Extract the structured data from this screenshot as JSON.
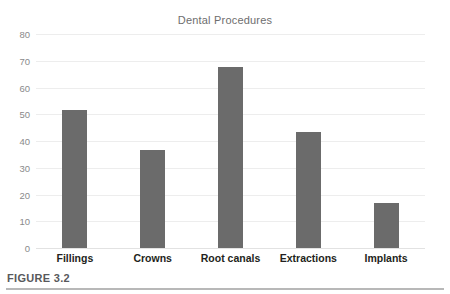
{
  "figure": {
    "caption": "FIGURE 3.2"
  },
  "chart_data": {
    "type": "bar",
    "title": "Dental Procedures",
    "xlabel": "",
    "ylabel": "",
    "categories": [
      "Fillings",
      "Crowns",
      "Root canals",
      "Extractions",
      "Implants"
    ],
    "values": [
      51.5,
      36.5,
      67.5,
      43.5,
      17
    ],
    "ylim": [
      0,
      80
    ],
    "ytick_labels": [
      "80",
      "70",
      "60",
      "50",
      "40",
      "30",
      "20",
      "10",
      "0"
    ],
    "ytick_values": [
      80,
      70,
      60,
      50,
      40,
      30,
      20,
      10,
      0
    ],
    "ytick_step": 10,
    "grid": true,
    "legend": false,
    "bar_color": "#6b6b6b",
    "gridline_color": "#ededed",
    "title_color": "#6e6e6e",
    "tick_label_color": "#8a8a8a",
    "category_label_color": "#231f20"
  }
}
